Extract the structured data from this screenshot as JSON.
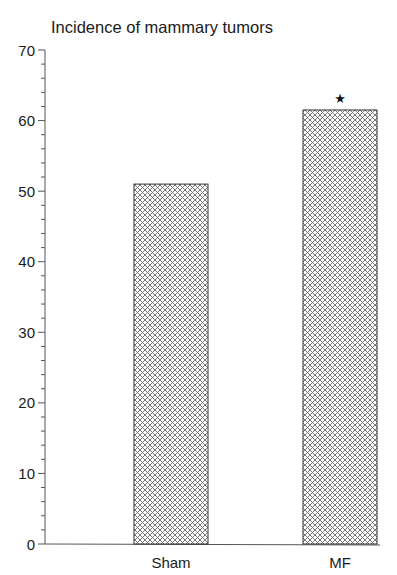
{
  "chart_data": {
    "type": "bar",
    "title": "Incidence of mammary tumors",
    "xlabel": "",
    "ylabel": "",
    "categories": [
      "Sham",
      "MF"
    ],
    "values": [
      51,
      61.5
    ],
    "annotations": [
      {
        "category": "MF",
        "text": "★",
        "meaning": "significance marker"
      }
    ],
    "ylim": [
      0,
      70
    ],
    "yticks": [
      0,
      10,
      20,
      30,
      40,
      50,
      60,
      70
    ],
    "minor_tick_step": 2,
    "grid": false,
    "legend": null,
    "bar_fill": "crosshatch",
    "colors": {
      "axis": "#555555",
      "bar_edge": "#333333",
      "hatch": "#555555",
      "text": "#1a1a1a"
    }
  }
}
